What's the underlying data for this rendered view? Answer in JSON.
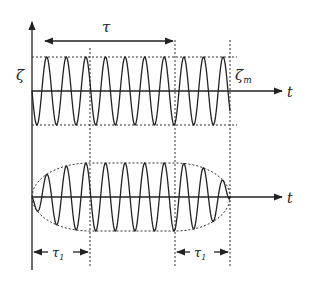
{
  "diagram": {
    "colors": {
      "line": "#222222",
      "dotted": "#333333",
      "background": "#ffffff"
    },
    "upper_panel": {
      "y_label": "ζ",
      "amplitude_label": "ζ",
      "amplitude_subscript": "m",
      "x_label": "t",
      "duration_label": "τ"
    },
    "lower_panel": {
      "x_label": "t",
      "rise_label": "τ",
      "rise_subscript": "1",
      "fall_label": "τ",
      "fall_subscript": "1"
    }
  }
}
